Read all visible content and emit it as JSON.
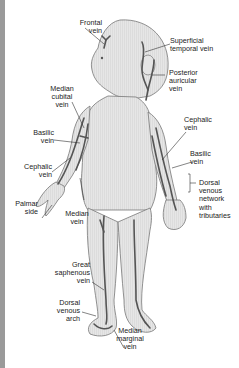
{
  "diagram": {
    "colors": {
      "skin_fill": "#e4e4e4",
      "outline": "#777777",
      "vein": "#555555",
      "leader_line": "#333333",
      "left_strip": "#9a9a9a"
    },
    "labels": {
      "frontal_vein": "Frontal\nvein",
      "superficial_temporal_vein": "Superficial\ntemporal vein",
      "posterior_auricular_vein": "Posterior\nauricular\nvein",
      "median_cubital_vein": "Median\ncubital\nvein",
      "basilic_vein_left": "Basilic\nvein",
      "cephalic_vein_left": "Cephalic\nvein",
      "palmar_side": "Palmar\nside",
      "median_vein": "Median\nvein",
      "cephalic_vein_right": "Cephalic\nvein",
      "basilic_vein_right": "Basilic\nvein",
      "dorsal_venous_network": "Dorsal\nvenous\nnetwork\nwith\ntributaries",
      "great_saphenous_vein": "Great\nsaphenous\nvein",
      "dorsal_venous_arch": "Dorsal\nvenous\narch",
      "median_marginal_vein": "Median\nmarginal\nvein"
    }
  }
}
